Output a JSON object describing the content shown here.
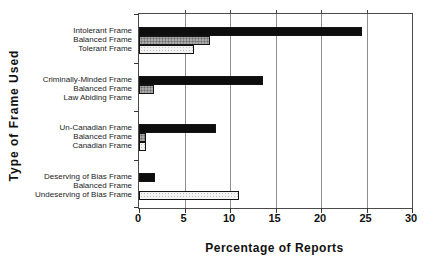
{
  "chart_data": {
    "type": "bar",
    "orientation": "horizontal",
    "title": "",
    "xlabel": "Percentage of Reports",
    "ylabel": "Type of Frame Used",
    "xlim": [
      0,
      30
    ],
    "xticks": [
      "0",
      "5",
      "10",
      "15",
      "20",
      "25",
      "30"
    ],
    "grid": "vertical-gridlines-on",
    "legend": "none",
    "bar_styles": {
      "black": {
        "fill": "#0d0d0d",
        "pattern": "solid"
      },
      "gray": {
        "fill": "#a9a9a9",
        "pattern": "halftone-dots"
      },
      "light": {
        "fill": "#f3f3f3",
        "pattern": "light-dots"
      }
    },
    "groups": [
      {
        "name": "intolerant-group",
        "bars": [
          {
            "label": "Intolerant Frame",
            "value": 24.5,
            "style": "black"
          },
          {
            "label": "Balanced Frame",
            "value": 7.8,
            "style": "gray"
          },
          {
            "label": "Tolerant Frame",
            "value": 6.0,
            "style": "light"
          }
        ]
      },
      {
        "name": "criminally-minded-group",
        "bars": [
          {
            "label": "Criminally-Minded Frame",
            "value": 13.6,
            "style": "black"
          },
          {
            "label": "Balanced Frame",
            "value": 1.7,
            "style": "gray"
          },
          {
            "label": "Law Abiding Frame",
            "value": 0,
            "style": "light"
          }
        ]
      },
      {
        "name": "un-canadian-group",
        "bars": [
          {
            "label": "Un-Canadian Frame",
            "value": 8.5,
            "style": "black"
          },
          {
            "label": "Balanced Frame",
            "value": 0.8,
            "style": "gray"
          },
          {
            "label": "Canadian Frame",
            "value": 0.8,
            "style": "light"
          }
        ]
      },
      {
        "name": "bias-group",
        "bars": [
          {
            "label": "Deserving of Bias Frame",
            "value": 1.8,
            "style": "black"
          },
          {
            "label": "Balanced Frame",
            "value": 0,
            "style": "gray"
          },
          {
            "label": "Undeserving of Bias Frame",
            "value": 11.0,
            "style": "light"
          }
        ]
      }
    ]
  }
}
